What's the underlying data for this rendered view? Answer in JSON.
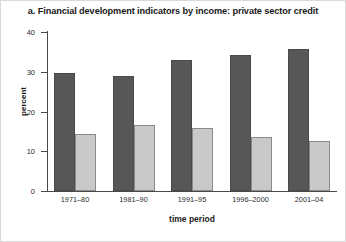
{
  "chart_data": {
    "type": "bar",
    "title": "a. Financial development indicators by income: private sector credit",
    "xlabel": "time period",
    "ylabel": "percent",
    "ylim": [
      0,
      40
    ],
    "yticks": [
      0,
      10,
      20,
      30,
      40
    ],
    "grid": false,
    "legend": "none",
    "categories": [
      "1971–80",
      "1981–90",
      "1991–95",
      "1996–2000",
      "2001–04"
    ],
    "series": [
      {
        "name": "series-1",
        "color": "#575757",
        "values": [
          29.7,
          29.0,
          33.0,
          34.2,
          35.8
        ]
      },
      {
        "name": "series-2",
        "color": "#c9c9c9",
        "values": [
          14.4,
          16.5,
          15.9,
          13.5,
          12.7
        ]
      }
    ]
  },
  "colors": {
    "series_dark": "#575757",
    "series_light": "#c9c9c9",
    "axis": "#4a4a4a",
    "text": "#1a1a1a",
    "background": "#ffffff"
  }
}
